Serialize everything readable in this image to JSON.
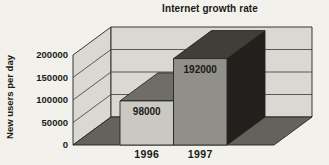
{
  "figure": {
    "title": "Internet growth rate",
    "y_axis_label": "New users per day"
  },
  "chart_data": {
    "type": "bar",
    "style": "3d-oblique",
    "title": "Internet growth rate",
    "categories": [
      "1996",
      "1997"
    ],
    "values": [
      98000,
      192000
    ],
    "value_labels": [
      "98000",
      "192000"
    ],
    "xlabel": "",
    "ylabel": "New users per day",
    "ylim": [
      0,
      200000
    ],
    "yticks": [
      0,
      50000,
      100000,
      150000,
      200000
    ],
    "ytick_labels": [
      "0",
      "50000",
      "100000",
      "150000",
      "200000"
    ],
    "grid": true,
    "legend": "none",
    "colors": {
      "background": "#f2f1ec",
      "wall": "#d9d8d3",
      "floor": "#64625b",
      "outline": "#26251f",
      "gridline": "#3a3933",
      "text": "#1b1a16",
      "bars": [
        {
          "front": "#c9c8c3",
          "top": "#6e6d67",
          "side": "#3a3832"
        },
        {
          "front": "#908f8a",
          "top": "#403e38",
          "side": "#21201c"
        }
      ]
    }
  }
}
